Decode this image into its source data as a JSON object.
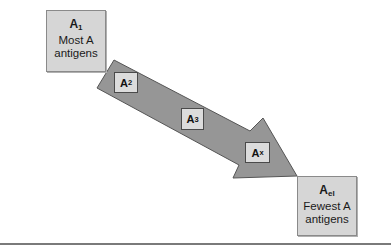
{
  "diagram": {
    "type": "flow-arrow",
    "start_box": {
      "label": "A",
      "subscript": "1",
      "line1": "Most A",
      "line2": "antigens"
    },
    "end_box": {
      "label": "A",
      "subscript": "el",
      "line1": "Fewest A",
      "line2": "antigens"
    },
    "steps": [
      {
        "label": "A",
        "subscript": "2"
      },
      {
        "label": "A",
        "subscript": "3"
      },
      {
        "label": "A",
        "subscript": "x"
      }
    ],
    "colors": {
      "arrow_fill": "#969696",
      "arrow_stroke": "#555555",
      "box_fill": "#d6d6d6",
      "rule": "#7a7a7a"
    }
  }
}
